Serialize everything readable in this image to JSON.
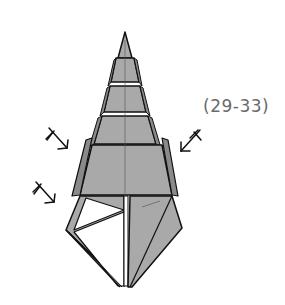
{
  "diagram": {
    "type": "origami-folding-step",
    "step_reference": "(29-33)",
    "colors": {
      "paper_colored": "#a9a9a9",
      "paper_white": "#ffffff",
      "outline": "#111111",
      "label_text": "#6a6a6a"
    },
    "symbols": [
      {
        "name": "inside-reverse-fold-arrow",
        "position": "left-upper",
        "direction": "down-right"
      },
      {
        "name": "inside-reverse-fold-arrow",
        "position": "left-lower",
        "direction": "down-right"
      },
      {
        "name": "inside-reverse-fold-arrow",
        "position": "right",
        "direction": "down-left"
      }
    ],
    "model": {
      "shape": "tiered-cone",
      "tiers": 4
    }
  }
}
